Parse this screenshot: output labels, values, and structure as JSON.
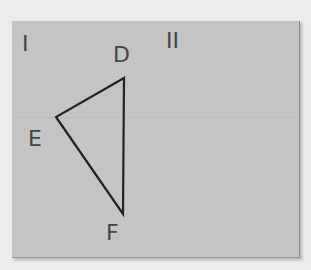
{
  "regions": {
    "left": "I",
    "right": "II"
  },
  "vertices": {
    "D": "D",
    "E": "E",
    "F": "F"
  },
  "triangle": {
    "D": [
      124,
      78
    ],
    "E": [
      56,
      117
    ],
    "F": [
      123,
      214
    ]
  },
  "colors": {
    "paper": "#c4c4c4",
    "ink": "#222222",
    "background": "#ececec"
  }
}
